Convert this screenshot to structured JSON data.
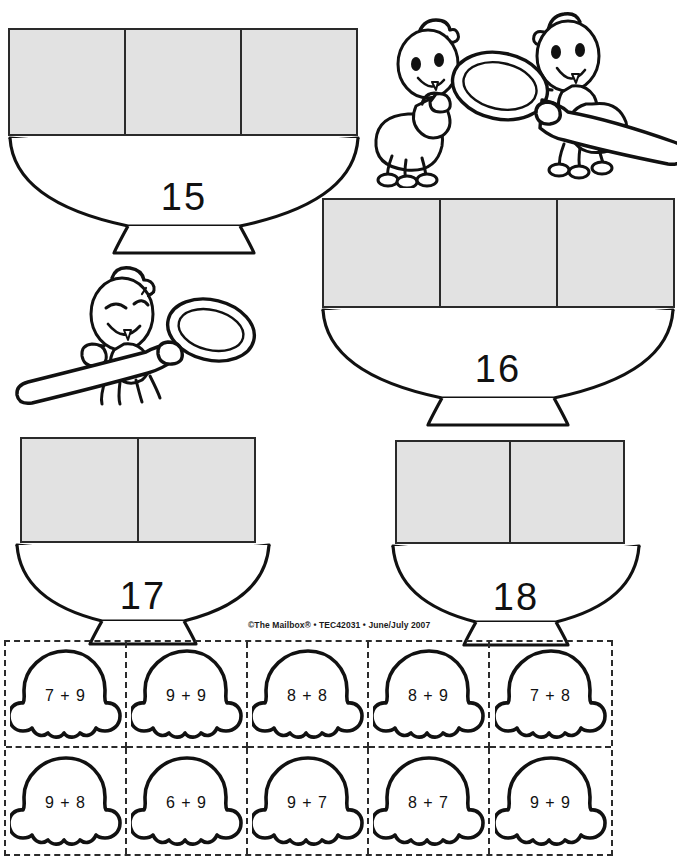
{
  "worksheet": {
    "credit": "©The Mailbox® • TEC42031 • June/July 2007",
    "ink_color": "#1a1a1a",
    "scoop_fill_color": "#e2e2e2"
  },
  "bowls": [
    {
      "id": "bowl-15",
      "number": "15",
      "scoop_count": 3,
      "position": "top-left"
    },
    {
      "id": "bowl-16",
      "number": "16",
      "scoop_count": 3,
      "position": "middle-right"
    },
    {
      "id": "bowl-17",
      "number": "17",
      "scoop_count": 2,
      "position": "bottom-left"
    },
    {
      "id": "bowl-18",
      "number": "18",
      "scoop_count": 2,
      "position": "bottom-right"
    }
  ],
  "ants": [
    {
      "id": "ant-pair-top-right",
      "label": "two ants holding a spoon",
      "count": 2
    },
    {
      "id": "ant-single-middle-left",
      "label": "ant holding a spoon",
      "count": 1
    }
  ],
  "cards": {
    "rows": 2,
    "cols": 5,
    "items": [
      {
        "equation": "7 + 9"
      },
      {
        "equation": "9 + 9"
      },
      {
        "equation": "8 + 8"
      },
      {
        "equation": "8 + 9"
      },
      {
        "equation": "7 + 8"
      },
      {
        "equation": "9 + 8"
      },
      {
        "equation": "6 + 9"
      },
      {
        "equation": "9 + 7"
      },
      {
        "equation": "8 + 7"
      },
      {
        "equation": "9 + 9"
      }
    ]
  }
}
